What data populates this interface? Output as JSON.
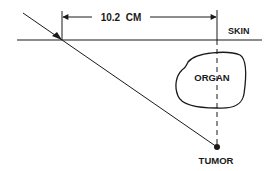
{
  "diagram": {
    "type": "anatomical-schematic",
    "labels": {
      "measurement": "10.2  CM",
      "skin": "SKIN",
      "organ": "ORGAN",
      "tumor": "TUMOR"
    },
    "measurement": {
      "value": 10.2,
      "unit": "CM"
    },
    "colors": {
      "stroke": "#1a1a1a",
      "background": "#ffffff"
    }
  }
}
